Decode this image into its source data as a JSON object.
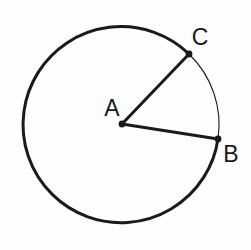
{
  "figure": {
    "background_color": "#fdfdfd",
    "stroke_color": "#1a1a1a",
    "width": 251,
    "height": 250,
    "circle": {
      "center_label": "A",
      "center_x": 122,
      "center_y": 124,
      "radius": 98,
      "major_arc_stroke_width": 3,
      "minor_arc_stroke_width": 1.1
    },
    "points": [
      {
        "label": "A",
        "role": "center",
        "x": 122,
        "y": 124,
        "dot_radius": 3.4,
        "label_x": 112,
        "label_y": 116
      },
      {
        "label": "C",
        "role": "on-circle",
        "x": 189,
        "y": 54,
        "dot_radius": 3.4,
        "label_x": 200,
        "label_y": 45
      },
      {
        "label": "B",
        "role": "on-circle",
        "x": 218,
        "y": 139,
        "dot_radius": 3.4,
        "label_x": 231,
        "label_y": 162
      }
    ],
    "radii": [
      {
        "name": "radius-AC",
        "from": "A",
        "to": "C",
        "x1": 122,
        "y1": 124,
        "x2": 189,
        "y2": 54,
        "stroke_width": 3
      },
      {
        "name": "radius-AB",
        "from": "A",
        "to": "B",
        "x1": 122,
        "y1": 124,
        "x2": 218,
        "y2": 139,
        "stroke_width": 3
      }
    ],
    "arcs": [
      {
        "name": "minor-arc-CB",
        "from": "C",
        "to": "B",
        "path": "M 189 54 A 98 98 0 0 1 218 139",
        "stroke_width": 1.1
      },
      {
        "name": "major-arc-BC",
        "from": "B",
        "to": "C",
        "path": "M 218 139 A 98 98 0 1 1 189 54",
        "stroke_width": 3
      }
    ]
  }
}
